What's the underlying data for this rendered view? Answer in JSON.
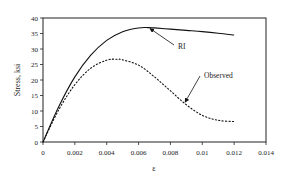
{
  "chart_data": {
    "type": "line",
    "title": "",
    "xlabel": "ε",
    "ylabel": "Stress, ksi",
    "xlim": [
      0,
      0.014
    ],
    "ylim": [
      0,
      40
    ],
    "x_ticks": [
      "0",
      "0.002",
      "0.004",
      "0.006",
      "0.008",
      "0.01",
      "0.012",
      "0.014"
    ],
    "y_ticks": [
      "0",
      "5",
      "10",
      "15",
      "20",
      "25",
      "30",
      "35",
      "40"
    ],
    "grid": false,
    "legend": "none (inline annotations with arrows)",
    "series": [
      {
        "name": "RI",
        "style": "solid",
        "x": [
          0,
          0.001,
          0.002,
          0.003,
          0.004,
          0.005,
          0.006,
          0.0066,
          0.007,
          0.008,
          0.009,
          0.01,
          0.011,
          0.012
        ],
        "y": [
          0,
          11.5,
          21.0,
          28.0,
          32.8,
          35.6,
          36.8,
          36.9,
          36.8,
          36.4,
          36.0,
          35.6,
          35.1,
          34.5
        ]
      },
      {
        "name": "Observed",
        "style": "dotted",
        "x": [
          0,
          0.001,
          0.002,
          0.003,
          0.004,
          0.0047,
          0.005,
          0.006,
          0.007,
          0.008,
          0.009,
          0.01,
          0.011,
          0.012
        ],
        "y": [
          0,
          10.5,
          18.5,
          23.8,
          26.4,
          26.7,
          26.5,
          24.8,
          21.0,
          16.5,
          12.0,
          8.6,
          7.0,
          6.6
        ]
      }
    ],
    "annotations": [
      {
        "text": "RI",
        "points_to_series": "RI",
        "arrow_target": [
          0.0066,
          36.9
        ]
      },
      {
        "text": "Observed",
        "points_to_series": "Observed",
        "arrow_target": [
          0.0088,
          13.2
        ]
      }
    ]
  }
}
